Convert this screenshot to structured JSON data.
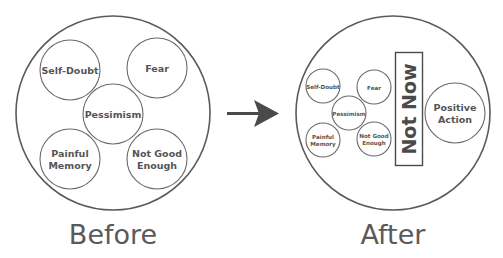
{
  "colors": {
    "background": "#ffffff",
    "stroke": "#5a5a5a",
    "text": "#555555",
    "arrow": "#4a4a4a"
  },
  "before": {
    "caption": "Before",
    "circles": [
      {
        "line1": "Self-Doubt",
        "line2": ""
      },
      {
        "line1": "Fear",
        "line2": ""
      },
      {
        "line1": "Pessimism",
        "line2": ""
      },
      {
        "line1": "Painful",
        "line2": "Memory"
      },
      {
        "line1": "Not Good",
        "line2": "Enough"
      }
    ]
  },
  "arrow": {
    "icon": "arrow-right-icon"
  },
  "after": {
    "caption": "After",
    "circles": [
      {
        "line1": "Self-Doubt",
        "line2": ""
      },
      {
        "line1": "Fear",
        "line2": ""
      },
      {
        "line1": "Pessimism",
        "line2": ""
      },
      {
        "line1": "Painful",
        "line2": "Memory"
      },
      {
        "line1": "Not Good",
        "line2": "Enough"
      }
    ],
    "barrier_label": "Not Now",
    "positive": {
      "line1": "Positive",
      "line2": "Action"
    }
  }
}
